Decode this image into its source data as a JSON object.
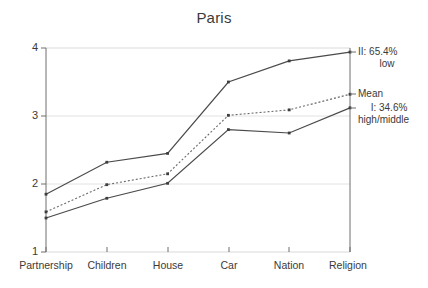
{
  "chart_data": {
    "type": "line",
    "title": "Paris",
    "xlabel": "",
    "ylabel": "",
    "categories": [
      "Partnership",
      "Children",
      "House",
      "Car",
      "Nation",
      "Religion"
    ],
    "ylim": [
      1,
      4
    ],
    "yticks": [
      1,
      2,
      3,
      4
    ],
    "grid": true,
    "legend_position": "right",
    "series": [
      {
        "name": "II: 65.4% low",
        "style": "solid",
        "values": [
          1.85,
          2.32,
          2.45,
          3.5,
          3.81,
          3.94
        ]
      },
      {
        "name": "Mean",
        "style": "dotted",
        "values": [
          1.59,
          1.99,
          2.15,
          3.01,
          3.09,
          3.32
        ]
      },
      {
        "name": "I: 34.6% high/middle",
        "style": "solid",
        "values": [
          1.5,
          1.79,
          2.01,
          2.8,
          2.75,
          3.12
        ]
      }
    ]
  },
  "legend": {
    "entries": [
      {
        "line1": "II: 65.4%",
        "line2": "low"
      },
      {
        "line1": "Mean",
        "line2": ""
      },
      {
        "line1": "I: 34.6%",
        "line2": "high/middle"
      }
    ]
  },
  "axis": {
    "y_tick_labels": [
      "4",
      "3",
      "2",
      "1"
    ]
  },
  "colors": {
    "line": "#4a4a4a",
    "grid": "#d8d8d8",
    "axis": "#6e6e6e",
    "text": "#3a3a3a"
  }
}
